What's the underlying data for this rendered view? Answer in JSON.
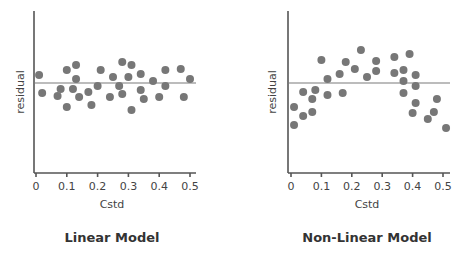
{
  "chart_data": [
    {
      "type": "scatter",
      "title": "Linear Model",
      "xlabel": "Cstd",
      "ylabel": "residual",
      "xlim": [
        0,
        0.5
      ],
      "xticks": [
        "0",
        "0.1",
        "0.2",
        "0.3",
        "0.4",
        "0.5"
      ],
      "grid": false,
      "reference_line": 0,
      "points": [
        [
          0.01,
          0.8
        ],
        [
          0.02,
          -1.0
        ],
        [
          0.07,
          -1.3
        ],
        [
          0.08,
          -0.6
        ],
        [
          0.1,
          1.3
        ],
        [
          0.1,
          -2.4
        ],
        [
          0.12,
          -0.6
        ],
        [
          0.13,
          1.8
        ],
        [
          0.13,
          0.4
        ],
        [
          0.14,
          -1.4
        ],
        [
          0.17,
          -0.9
        ],
        [
          0.18,
          -2.2
        ],
        [
          0.2,
          -0.3
        ],
        [
          0.21,
          1.3
        ],
        [
          0.24,
          -1.4
        ],
        [
          0.25,
          0.6
        ],
        [
          0.27,
          -0.3
        ],
        [
          0.28,
          2.1
        ],
        [
          0.28,
          -1.1
        ],
        [
          0.3,
          0.6
        ],
        [
          0.31,
          1.8
        ],
        [
          0.31,
          -2.7
        ],
        [
          0.34,
          0.9
        ],
        [
          0.34,
          -0.7
        ],
        [
          0.35,
          -1.6
        ],
        [
          0.38,
          0.2
        ],
        [
          0.4,
          -1.4
        ],
        [
          0.42,
          1.3
        ],
        [
          0.42,
          -0.3
        ],
        [
          0.47,
          1.4
        ],
        [
          0.48,
          -1.4
        ],
        [
          0.5,
          0.4
        ]
      ]
    },
    {
      "type": "scatter",
      "title": "Non-Linear Model",
      "xlabel": "Cstd",
      "ylabel": "residual",
      "xlim": [
        0,
        0.5
      ],
      "xticks": [
        "0",
        "0.1",
        "0.2",
        "0.3",
        "0.4",
        "0.5"
      ],
      "grid": false,
      "reference_line": 0,
      "points": [
        [
          0.01,
          -2.4
        ],
        [
          0.01,
          -4.2
        ],
        [
          0.04,
          -0.9
        ],
        [
          0.04,
          -3.3
        ],
        [
          0.07,
          -1.6
        ],
        [
          0.07,
          -2.9
        ],
        [
          0.08,
          -0.7
        ],
        [
          0.1,
          2.3
        ],
        [
          0.12,
          0.4
        ],
        [
          0.12,
          -1.2
        ],
        [
          0.16,
          0.9
        ],
        [
          0.17,
          -1.0
        ],
        [
          0.18,
          2.1
        ],
        [
          0.21,
          1.4
        ],
        [
          0.23,
          3.3
        ],
        [
          0.25,
          0.6
        ],
        [
          0.28,
          2.2
        ],
        [
          0.28,
          1.2
        ],
        [
          0.34,
          2.6
        ],
        [
          0.34,
          1.0
        ],
        [
          0.37,
          1.3
        ],
        [
          0.37,
          0.2
        ],
        [
          0.37,
          -1.0
        ],
        [
          0.39,
          2.9
        ],
        [
          0.41,
          0.8
        ],
        [
          0.41,
          -0.3
        ],
        [
          0.41,
          -2.0
        ],
        [
          0.4,
          -3.0
        ],
        [
          0.45,
          -3.6
        ],
        [
          0.47,
          -2.9
        ],
        [
          0.48,
          -1.6
        ],
        [
          0.51,
          -4.5
        ]
      ]
    }
  ],
  "panels": [
    {
      "title": "Linear Model",
      "xlabel": "Cstd",
      "ylabel": "residual",
      "xticks": [
        "0",
        "0.1",
        "0.2",
        "0.3",
        "0.4",
        "0.5"
      ]
    },
    {
      "title": "Non-Linear Model",
      "xlabel": "Cstd",
      "ylabel": "residual",
      "xticks": [
        "0",
        "0.1",
        "0.2",
        "0.3",
        "0.4",
        "0.5"
      ]
    }
  ],
  "colors": {
    "dots": "#777777",
    "axis": "#555555",
    "reference_line": "#7a7a7a",
    "text": "#444444"
  }
}
